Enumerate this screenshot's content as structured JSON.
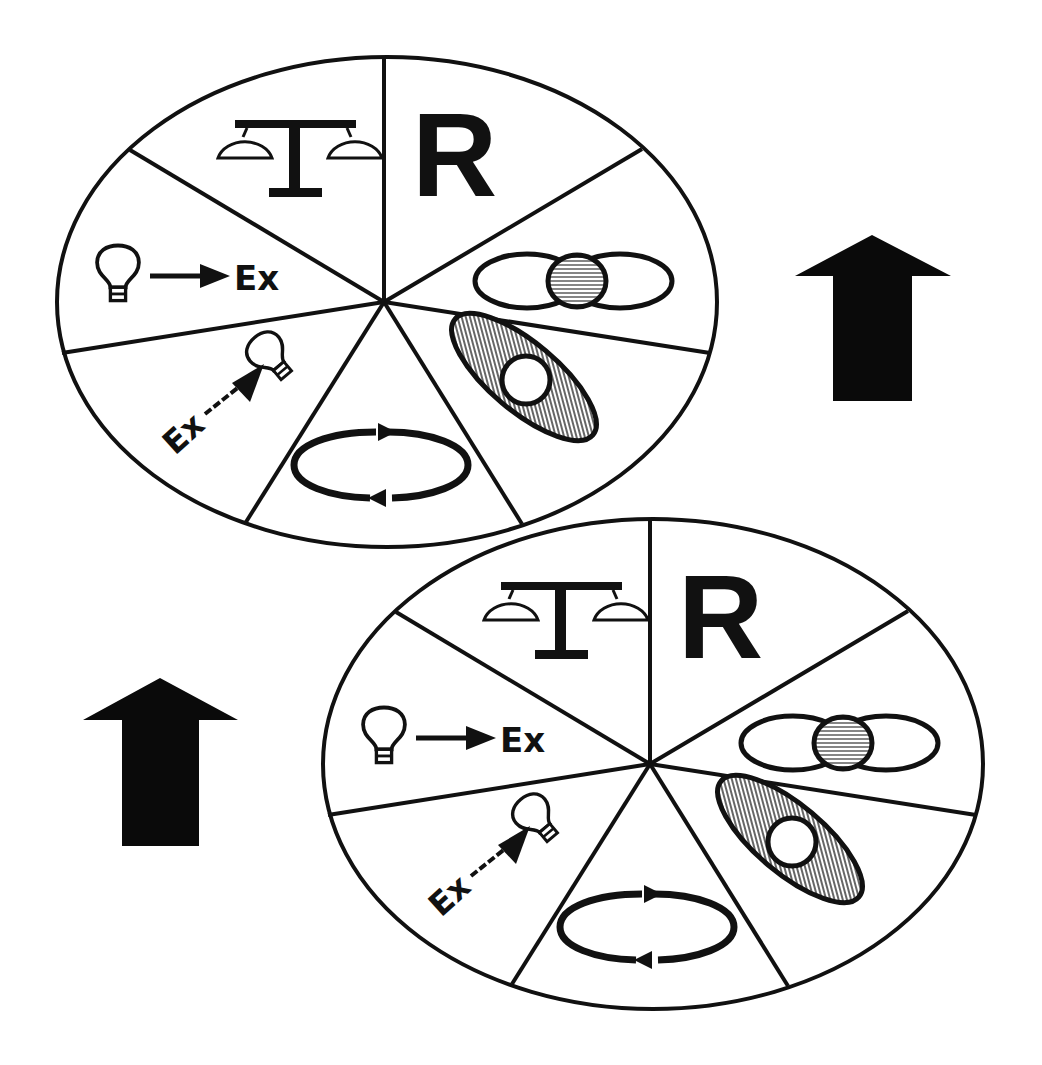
{
  "diagram": {
    "background": "#ffffff",
    "ink_color": "#111111",
    "hatch_color": "#888888",
    "wheels": [
      {
        "id": "wheel-top",
        "segments": [
          {
            "position": "top-left",
            "icon": "scale-icon",
            "label": ""
          },
          {
            "position": "top-right",
            "icon": "letter-r",
            "label": "R"
          },
          {
            "position": "right-upper",
            "icon": "overlapping-ellipses-icon",
            "label": ""
          },
          {
            "position": "right-lower",
            "icon": "tilted-ellipse-icon",
            "label": ""
          },
          {
            "position": "bottom",
            "icon": "cycle-arrows-icon",
            "label": ""
          },
          {
            "position": "left-lower",
            "icon": "ex-to-bulb-icon",
            "label": "Ex"
          },
          {
            "position": "left-upper",
            "icon": "bulb-to-ex-icon",
            "label": "Ex"
          }
        ]
      },
      {
        "id": "wheel-bottom",
        "segments": [
          {
            "position": "top-left",
            "icon": "scale-icon",
            "label": ""
          },
          {
            "position": "top-right",
            "icon": "letter-r",
            "label": "R"
          },
          {
            "position": "right-upper",
            "icon": "overlapping-ellipses-icon",
            "label": ""
          },
          {
            "position": "right-lower",
            "icon": "tilted-ellipse-icon",
            "label": ""
          },
          {
            "position": "bottom",
            "icon": "cycle-arrows-icon",
            "label": ""
          },
          {
            "position": "left-lower",
            "icon": "ex-to-bulb-icon",
            "label": "Ex"
          },
          {
            "position": "left-upper",
            "icon": "bulb-to-ex-icon",
            "label": "Ex"
          }
        ]
      }
    ],
    "arrows": [
      {
        "id": "arrow-right",
        "direction": "up"
      },
      {
        "id": "arrow-left",
        "direction": "up"
      }
    ]
  }
}
